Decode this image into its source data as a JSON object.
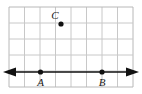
{
  "figure": {
    "background_color": "#ffffff",
    "grid": {
      "color": "#c8c8c8",
      "border_color": "#b4b4b4",
      "columns": 8,
      "rows": 5,
      "left": 9,
      "top": 7,
      "right": 133,
      "bottom": 87,
      "cell_width": 15.5,
      "cell_height": 16
    },
    "line": {
      "name": "horizontal-double-arrow-line",
      "color": "#111111",
      "stroke_width": 1.6,
      "y": 72,
      "x_start": 3,
      "x_end": 139,
      "arrow_left": true,
      "arrow_right": true
    },
    "points": [
      {
        "label": "C",
        "cx": 61,
        "cy": 24,
        "r": 2.6,
        "color": "#111111",
        "label_x": 55,
        "label_y": 18,
        "label_position": "above-left"
      },
      {
        "label": "A",
        "cx": 40.5,
        "cy": 72,
        "r": 2.6,
        "color": "#111111",
        "label_x": 37,
        "label_y": 85,
        "label_position": "below"
      },
      {
        "label": "B",
        "cx": 102,
        "cy": 72,
        "r": 2.6,
        "color": "#111111",
        "label_x": 98,
        "label_y": 85,
        "label_position": "below"
      }
    ]
  }
}
